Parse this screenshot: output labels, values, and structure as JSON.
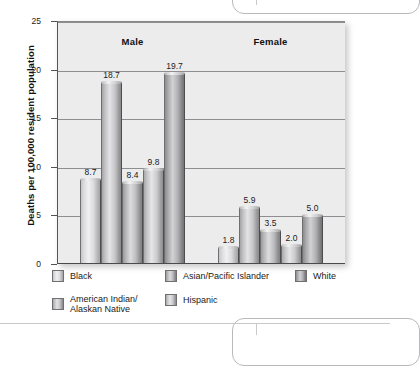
{
  "chart_data": {
    "type": "bar",
    "title": "",
    "xlabel": "",
    "ylabel": "Deaths per 100,000 resident population",
    "ylim": [
      0,
      25
    ],
    "yticks": [
      "0",
      "5",
      "10",
      "15",
      "20",
      "25"
    ],
    "grid": true,
    "legend_position": "bottom",
    "groups": [
      "Male",
      "Female"
    ],
    "categories": [
      "Male",
      "Female"
    ],
    "series": [
      {
        "name": "Black",
        "values": [
          8.7,
          1.8
        ],
        "labels": [
          "8.7",
          "1.8"
        ],
        "color": "#e4e4e6"
      },
      {
        "name": "American Indian/\nAlaskan Native",
        "values": [
          18.7,
          5.9
        ],
        "labels": [
          "18.7",
          "5.9"
        ],
        "color": "#c4c4c7"
      },
      {
        "name": "Asian/Pacific Islander",
        "values": [
          8.4,
          3.5
        ],
        "labels": [
          "8.4",
          "3.5"
        ],
        "color": "#b5b5b8"
      },
      {
        "name": "Hispanic",
        "values": [
          9.8,
          2.0
        ],
        "labels": [
          "9.8",
          "2.0"
        ],
        "color": "#cacacd"
      },
      {
        "name": "White",
        "values": [
          19.7,
          5.0
        ],
        "labels": [
          "19.7",
          "5.0"
        ],
        "color": "#a2a2a5"
      }
    ]
  },
  "axis": {
    "y_title": "Deaths per 100,000 resident population",
    "ticks": [
      {
        "label": "25",
        "value": 25
      },
      {
        "label": "20",
        "value": 20
      },
      {
        "label": "15",
        "value": 15
      },
      {
        "label": "10",
        "value": 10
      },
      {
        "label": "5",
        "value": 5
      },
      {
        "label": "0",
        "value": 0
      }
    ]
  },
  "groups": [
    {
      "header": "Male",
      "bars": [
        {
          "series": "Black",
          "label": "8.7",
          "value": 8.7
        },
        {
          "series": "American Indian/Alaskan Native",
          "label": "18.7",
          "value": 18.7
        },
        {
          "series": "Asian/Pacific Islander",
          "label": "8.4",
          "value": 8.4
        },
        {
          "series": "Hispanic",
          "label": "9.8",
          "value": 9.8
        },
        {
          "series": "White",
          "label": "19.7",
          "value": 19.7
        }
      ]
    },
    {
      "header": "Female",
      "bars": [
        {
          "series": "Black",
          "label": "1.8",
          "value": 1.8
        },
        {
          "series": "American Indian/Alaskan Native",
          "label": "5.9",
          "value": 5.9
        },
        {
          "series": "Asian/Pacific Islander",
          "label": "3.5",
          "value": 3.5
        },
        {
          "series": "Hispanic",
          "label": "2.0",
          "value": 2.0
        },
        {
          "series": "White",
          "label": "5.0",
          "value": 5.0
        }
      ]
    }
  ],
  "legend": {
    "row1": [
      {
        "label": "Black"
      },
      {
        "label": "Asian/Pacific Islander"
      },
      {
        "label": "White"
      }
    ],
    "row2": [
      {
        "label": "American Indian/\nAlaskan Native"
      },
      {
        "label": "Hispanic"
      }
    ]
  }
}
